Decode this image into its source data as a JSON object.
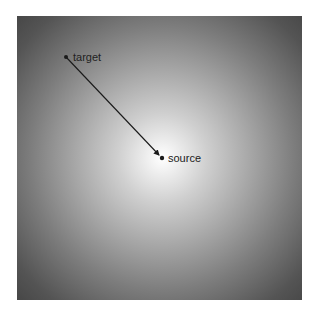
{
  "diagram": {
    "background": {
      "type": "radial-gradient",
      "center_color": "#ffffff",
      "edge_color": "#474747"
    },
    "nodes": [
      {
        "id": "target",
        "label": "target",
        "x": 66,
        "y": 57
      },
      {
        "id": "source",
        "label": "source",
        "x": 162,
        "y": 158
      }
    ],
    "edges": [
      {
        "from": "target",
        "to": "source",
        "arrow": "end",
        "color": "#1a1a1a"
      }
    ]
  }
}
